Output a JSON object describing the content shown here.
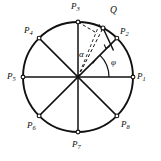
{
  "figure": {
    "type": "geometry-diagram",
    "background_color": "#ffffff",
    "stroke_color": "#111111"
  },
  "circle": {
    "center_x": 78,
    "center_y": 77,
    "radius": 55,
    "stroke_width": 1.8
  },
  "points": [
    {
      "id": "P1",
      "label": "P",
      "subscript": "1",
      "angle_deg": 0,
      "label_x": 137,
      "label_y": 72
    },
    {
      "id": "P2",
      "label": "P",
      "subscript": "2",
      "angle_deg": 45,
      "label_x": 120,
      "label_y": 27
    },
    {
      "id": "P3",
      "label": "P",
      "subscript": "3",
      "angle_deg": 90,
      "label_x": 71,
      "label_y": 2
    },
    {
      "id": "P4",
      "label": "P",
      "subscript": "4",
      "angle_deg": 135,
      "label_x": 24,
      "label_y": 26
    },
    {
      "id": "P5",
      "label": "P",
      "subscript": "5",
      "angle_deg": 180,
      "label_x": 7,
      "label_y": 72
    },
    {
      "id": "P6",
      "label": "P",
      "subscript": "6",
      "angle_deg": 225,
      "label_x": 27,
      "label_y": 121
    },
    {
      "id": "P7",
      "label": "P",
      "subscript": "7",
      "angle_deg": 270,
      "label_x": 72,
      "label_y": 140
    },
    {
      "id": "P8",
      "label": "P",
      "subscript": "8",
      "angle_deg": 315,
      "label_x": 121,
      "label_y": 120
    }
  ],
  "q_point": {
    "id": "Q",
    "label": "Q",
    "angle_deg": 63,
    "label_x": 110,
    "label_y": 6,
    "marker_radius": 2.0
  },
  "angles": [
    {
      "id": "alpha",
      "symbol": "α",
      "from_deg": 45,
      "to_deg": 63,
      "arc_radius": 33,
      "label_x": 79,
      "label_y": 50
    },
    {
      "id": "phi",
      "symbol": "φ",
      "from_deg": 0,
      "to_deg": 45,
      "arc_radius": 31,
      "label_x": 111,
      "label_y": 58
    }
  ],
  "construction_lines": [
    {
      "id": "diameter-P1-P5",
      "style": "solid"
    },
    {
      "id": "diameter-P2-P6",
      "style": "solid"
    },
    {
      "id": "diameter-P3-P7",
      "style": "solid"
    },
    {
      "id": "diameter-P4-P8",
      "style": "solid"
    },
    {
      "id": "center-to-Q",
      "style": "dashed"
    },
    {
      "id": "P3-to-Q",
      "style": "dashed"
    },
    {
      "id": "Q-perpendicular-to-P2-radius",
      "style": "solid"
    }
  ]
}
